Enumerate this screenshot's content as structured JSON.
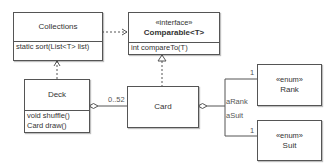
{
  "diagram": {
    "type": "uml-class",
    "classes": {
      "collections": {
        "name": "Collections",
        "methods": [
          "static sort(List<T> list)"
        ]
      },
      "comparable": {
        "stereotype": "«interface»",
        "name": "Comparable<T>",
        "methods": [
          "int compareTo(T)"
        ]
      },
      "deck": {
        "name": "Deck",
        "methods": [
          "void shuffle()",
          "Card draw()"
        ]
      },
      "card": {
        "name": "Card"
      },
      "rank": {
        "stereotype": "«enum»",
        "name": "Rank"
      },
      "suit": {
        "stereotype": "«enum»",
        "name": "Suit"
      }
    },
    "relationships": [
      {
        "from": "Collections",
        "to": "Comparable<T>",
        "kind": "dependency"
      },
      {
        "from": "Deck",
        "to": "Collections",
        "kind": "dependency"
      },
      {
        "from": "Card",
        "to": "Comparable<T>",
        "kind": "realization"
      },
      {
        "from": "Deck",
        "to": "Card",
        "kind": "aggregation",
        "multiplicity": "0..52"
      },
      {
        "from": "Card",
        "to": "Rank",
        "kind": "aggregation",
        "role": "aRank",
        "multiplicity": "1"
      },
      {
        "from": "Card",
        "to": "Suit",
        "kind": "aggregation",
        "role": "aSuit",
        "multiplicity": "1"
      }
    ],
    "labels": {
      "deck_card_multiplicity": "0..52",
      "rank_role": "aRank",
      "suit_role": "aSuit",
      "rank_multiplicity": "1",
      "suit_multiplicity": "1"
    },
    "colors": {
      "line": "#555555",
      "text": "#333333",
      "background": "#ffffff"
    }
  }
}
